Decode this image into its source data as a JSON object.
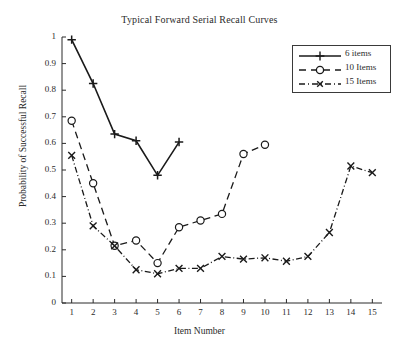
{
  "chart_data": {
    "type": "line",
    "title": "Typical Forward Serial Recall Curves",
    "xlabel": "Item Number",
    "ylabel": "Probability of Successful Recall",
    "x": [
      1,
      2,
      3,
      4,
      5,
      6,
      7,
      8,
      9,
      10,
      11,
      12,
      13,
      14,
      15
    ],
    "xlim": [
      0.55,
      15.45
    ],
    "ylim": [
      0,
      1
    ],
    "xticks": [
      "1",
      "2",
      "3",
      "4",
      "5",
      "6",
      "7",
      "8",
      "9",
      "10",
      "11",
      "12",
      "13",
      "14",
      "15"
    ],
    "yticks": [
      "0",
      "0.1",
      "0.2",
      "0.3",
      "0.4",
      "0.5",
      "0.6",
      "0.7",
      "0.8",
      "0.9",
      "1"
    ],
    "grid": false,
    "legend_position": "top-right",
    "series": [
      {
        "name": "6 items",
        "marker": "plus",
        "line_style": "solid",
        "color": "#1a1a1a",
        "x": [
          1,
          2,
          3,
          4,
          5,
          6
        ],
        "values": [
          0.99,
          0.825,
          0.635,
          0.61,
          0.48,
          0.605
        ]
      },
      {
        "name": "10 Items",
        "marker": "circle",
        "line_style": "dashed",
        "color": "#1a1a1a",
        "x": [
          1,
          2,
          3,
          4,
          5,
          6,
          7,
          8,
          9,
          10
        ],
        "values": [
          0.685,
          0.45,
          0.215,
          0.235,
          0.15,
          0.285,
          0.31,
          0.335,
          0.56,
          0.595
        ]
      },
      {
        "name": "15 Items",
        "marker": "cross",
        "line_style": "dashdot",
        "color": "#1a1a1a",
        "x": [
          1,
          2,
          3,
          4,
          5,
          6,
          7,
          8,
          9,
          10,
          11,
          12,
          13,
          14,
          15
        ],
        "values": [
          0.555,
          0.29,
          0.215,
          0.125,
          0.11,
          0.13,
          0.13,
          0.175,
          0.165,
          0.17,
          0.157,
          0.175,
          0.265,
          0.515,
          0.49
        ]
      }
    ]
  }
}
